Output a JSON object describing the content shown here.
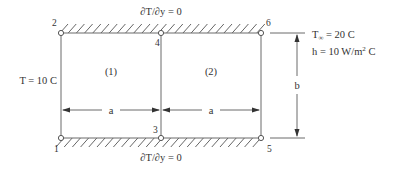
{
  "diagram": {
    "type": "finite-element-mesh",
    "elements": [
      {
        "id": "element-1",
        "label": "(1)"
      },
      {
        "id": "element-2",
        "label": "(2)"
      }
    ],
    "nodes": [
      {
        "id": "1",
        "label": "1"
      },
      {
        "id": "2",
        "label": "2"
      },
      {
        "id": "3",
        "label": "3"
      },
      {
        "id": "4",
        "label": "4"
      },
      {
        "id": "5",
        "label": "5"
      },
      {
        "id": "6",
        "label": "6"
      }
    ],
    "boundary_conditions": {
      "top": "∂T/∂y = 0",
      "bottom": "∂T/∂y = 0",
      "left": "T = 10 C",
      "right_ambient_prefix": "T",
      "right_ambient_sub": "∞",
      "right_ambient_value": " = 20 C",
      "right_h_prefix": "h = 10 W/m",
      "right_h_sup": "2",
      "right_h_suffix": " C"
    },
    "dimensions": {
      "width_1": "a",
      "width_2": "a",
      "height": "b"
    },
    "colors": {
      "line": "#6a6a6a",
      "text": "#333333"
    }
  }
}
